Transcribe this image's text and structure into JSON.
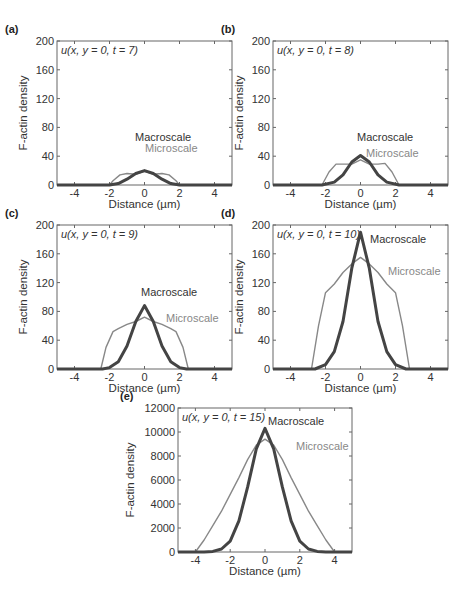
{
  "chart_data": [
    {
      "panel": "(a)",
      "type": "line",
      "annotation": "u(x, y = 0, t = 7)",
      "xlabel": "Distance (µm)",
      "ylabel": "F-actin density",
      "xlim": [
        -5,
        5
      ],
      "ylim": [
        0,
        200
      ],
      "xticks": [
        -4,
        -2,
        0,
        2,
        4
      ],
      "yticks": [
        0,
        40,
        80,
        120,
        160,
        200
      ],
      "series": [
        {
          "name": "Macroscale",
          "color": "#444444",
          "width": 3,
          "x": [
            -5,
            -2,
            -1.5,
            -1,
            -0.5,
            0,
            0.5,
            1,
            1.5,
            2,
            5
          ],
          "y": [
            0,
            0,
            2,
            8,
            16,
            20,
            16,
            8,
            2,
            0,
            0
          ]
        },
        {
          "name": "Microscale",
          "color": "#888888",
          "width": 1.4,
          "x": [
            -5,
            -2,
            -1.8,
            -1.4,
            -1,
            -0.5,
            0,
            0.5,
            1,
            1.4,
            1.8,
            2,
            5
          ],
          "y": [
            0,
            0,
            6,
            14,
            16,
            15,
            19,
            15,
            16,
            14,
            6,
            0,
            0
          ]
        }
      ],
      "labels": {
        "macro": "Macroscale",
        "micro": "Microscale"
      }
    },
    {
      "panel": "(b)",
      "type": "line",
      "annotation": "u(x, y = 0, t = 8)",
      "xlabel": "Distance (µm)",
      "ylabel": "F-actin density",
      "xlim": [
        -5,
        5
      ],
      "ylim": [
        0,
        200
      ],
      "xticks": [
        -4,
        -2,
        0,
        2,
        4
      ],
      "yticks": [
        0,
        40,
        80,
        120,
        160,
        200
      ],
      "series": [
        {
          "name": "Macroscale",
          "color": "#444444",
          "width": 3,
          "x": [
            -5,
            -2.2,
            -1.5,
            -1,
            -0.5,
            0,
            0.5,
            1,
            1.5,
            2.2,
            5
          ],
          "y": [
            0,
            0,
            4,
            14,
            32,
            41,
            32,
            14,
            4,
            0,
            0
          ]
        },
        {
          "name": "Microscale",
          "color": "#888888",
          "width": 1.4,
          "x": [
            -5,
            -2.2,
            -1.8,
            -1.4,
            -1,
            -0.5,
            0,
            0.5,
            1,
            1.4,
            1.8,
            2.2,
            5
          ],
          "y": [
            0,
            0,
            18,
            29,
            29,
            29,
            35,
            29,
            29,
            30,
            18,
            0,
            0
          ]
        }
      ],
      "labels": {
        "macro": "Macroscale",
        "micro": "Microscale"
      }
    },
    {
      "panel": "(c)",
      "type": "line",
      "annotation": "u(x, y = 0, t = 9)",
      "xlabel": "Distance (µm)",
      "ylabel": "F-actin density",
      "xlim": [
        -5,
        5
      ],
      "ylim": [
        0,
        200
      ],
      "xticks": [
        -4,
        -2,
        0,
        2,
        4
      ],
      "yticks": [
        0,
        40,
        80,
        120,
        160,
        200
      ],
      "series": [
        {
          "name": "Macroscale",
          "color": "#444444",
          "width": 3,
          "x": [
            -5,
            -2.4,
            -2,
            -1.5,
            -1,
            -0.5,
            0,
            0.5,
            1,
            1.5,
            2,
            2.4,
            5
          ],
          "y": [
            0,
            0,
            2,
            10,
            32,
            66,
            88,
            66,
            32,
            10,
            2,
            0,
            0
          ]
        },
        {
          "name": "Microscale",
          "color": "#888888",
          "width": 1.4,
          "x": [
            -5,
            -2.5,
            -2.2,
            -1.8,
            -1.5,
            -1,
            -0.5,
            0,
            0.5,
            1,
            1.5,
            1.8,
            2.2,
            2.5,
            5
          ],
          "y": [
            0,
            0,
            30,
            52,
            56,
            62,
            66,
            72,
            66,
            62,
            56,
            52,
            30,
            0,
            0
          ]
        }
      ],
      "labels": {
        "macro": "Macroscale",
        "micro": "Microscale"
      }
    },
    {
      "panel": "(d)",
      "type": "line",
      "annotation": "u(x, y = 0, t = 10)",
      "xlabel": "Distance (µm)",
      "ylabel": "F-actin density",
      "xlim": [
        -5,
        5
      ],
      "ylim": [
        0,
        200
      ],
      "xticks": [
        -4,
        -2,
        0,
        2,
        4
      ],
      "yticks": [
        0,
        40,
        80,
        120,
        160,
        200
      ],
      "series": [
        {
          "name": "Macroscale",
          "color": "#444444",
          "width": 3,
          "x": [
            -5,
            -2.6,
            -2,
            -1.5,
            -1,
            -0.5,
            0,
            0.5,
            1,
            1.5,
            2,
            2.6,
            5
          ],
          "y": [
            0,
            0,
            6,
            24,
            66,
            140,
            190,
            140,
            66,
            24,
            6,
            0,
            0
          ]
        },
        {
          "name": "Microscale",
          "color": "#888888",
          "width": 1.4,
          "x": [
            -5,
            -2.8,
            -2.4,
            -2,
            -1.5,
            -1,
            -0.5,
            0,
            0.5,
            1,
            1.5,
            2,
            2.4,
            2.8,
            5
          ],
          "y": [
            0,
            0,
            60,
            106,
            118,
            134,
            146,
            155,
            146,
            134,
            118,
            106,
            60,
            0,
            0
          ]
        }
      ],
      "labels": {
        "macro": "Macroscale",
        "micro": "Microscale"
      }
    },
    {
      "panel": "(e)",
      "type": "line",
      "annotation": "u(x, y = 0, t = 15)",
      "xlabel": "Distance (µm)",
      "ylabel": "F-actin density",
      "xlim": [
        -5,
        5
      ],
      "ylim": [
        0,
        12000
      ],
      "xticks": [
        -4,
        -2,
        0,
        2,
        4
      ],
      "yticks": [
        0,
        2000,
        4000,
        6000,
        8000,
        10000,
        12000
      ],
      "series": [
        {
          "name": "Macroscale",
          "color": "#444444",
          "width": 3,
          "x": [
            -5,
            -3.5,
            -3,
            -2.5,
            -2,
            -1.5,
            -1,
            -0.5,
            0,
            0.5,
            1,
            1.5,
            2,
            2.5,
            3,
            3.5,
            5
          ],
          "y": [
            0,
            0,
            50,
            250,
            900,
            2600,
            5400,
            8600,
            10300,
            8600,
            5400,
            2600,
            900,
            250,
            50,
            0,
            0
          ]
        },
        {
          "name": "Microscale",
          "color": "#888888",
          "width": 1.4,
          "x": [
            -5,
            -4,
            -3.5,
            -3,
            -2.5,
            -2,
            -1.5,
            -1,
            -0.5,
            0,
            0.5,
            1,
            1.5,
            2,
            2.5,
            3,
            3.5,
            4,
            5
          ],
          "y": [
            0,
            0,
            1000,
            2200,
            3400,
            4800,
            6200,
            7700,
            8900,
            9400,
            8900,
            7700,
            6200,
            4800,
            3400,
            2200,
            1000,
            0,
            0
          ]
        }
      ],
      "labels": {
        "macro": "Macroscale",
        "micro": "Microscale"
      }
    }
  ]
}
